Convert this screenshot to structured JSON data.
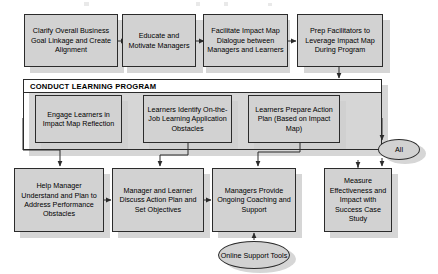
{
  "diagram": {
    "colors": {
      "node_fill": "#d2d2d2",
      "node_border": "#2b2b2b",
      "shadow": "#cfcfcf",
      "header_bg": "#ffffff",
      "text": "#000000"
    },
    "row1": [
      {
        "id": "clarify-goal",
        "label": "Clarify Overall Business Goal Linkage and Create Alignment"
      },
      {
        "id": "educate-managers",
        "label": "Educate and Motivate Managers"
      },
      {
        "id": "facilitate-dialogue",
        "label": "Facilitate Impact Map Dialogue between Managers and Learners"
      },
      {
        "id": "prep-facilitators",
        "label": "Prep Facilitators to Leverage Impact Map During Program"
      }
    ],
    "group": {
      "header": "CONDUCT LEARNING PROGRAM",
      "items": [
        {
          "id": "engage-learners",
          "label": "Engage Learners in Impact Map Reflection"
        },
        {
          "id": "identify-obstacles",
          "label": "Learners Identify On-the-Job Learning Application Obstacles"
        },
        {
          "id": "prepare-action-plan",
          "label": "Learners Prepare Action Plan (Based on Impact Map)"
        }
      ]
    },
    "row3": [
      {
        "id": "help-manager",
        "label": "Help Manager Understand and Plan to Address Performance Obstacles"
      },
      {
        "id": "discuss-action-plan",
        "label": "Manager and Learner Discuss Action Plan and Set Objectives"
      },
      {
        "id": "ongoing-coaching",
        "label": "Managers Provide Ongoing Coaching and Support"
      },
      {
        "id": "measure-effectiveness",
        "label": "Measure Effectiveness and Impact with Success Case Study"
      }
    ],
    "ellipses": [
      {
        "id": "all-gate",
        "label": "All"
      },
      {
        "id": "online-support-tools",
        "label": "Online Support Tools"
      }
    ]
  }
}
